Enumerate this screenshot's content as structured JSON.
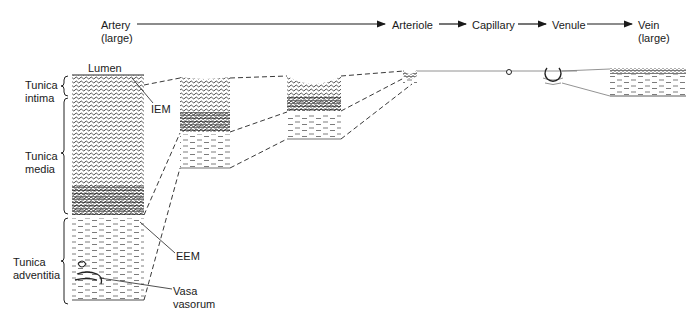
{
  "flow": {
    "stages": [
      {
        "id": "artery",
        "label": "Artery\n(large)"
      },
      {
        "id": "arteriole",
        "label": "Arteriole"
      },
      {
        "id": "capillary",
        "label": "Capillary"
      },
      {
        "id": "venule",
        "label": "Venule"
      },
      {
        "id": "vein",
        "label": "Vein\n(large)"
      }
    ]
  },
  "layers": {
    "lumen": "Lumen",
    "intima": "Tunica\nintima",
    "media": "Tunica\nmedia",
    "adventitia": "Tunica\nadventitia"
  },
  "annotations": {
    "iem": "IEM",
    "eem": "EEM",
    "vasa": "Vasa\nvasorum"
  },
  "colors": {
    "ink": "#1a1a1a",
    "line": "#333333",
    "background": "#ffffff"
  }
}
